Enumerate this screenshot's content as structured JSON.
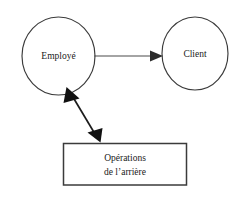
{
  "diagram": {
    "type": "flow-diagram",
    "background_color": "#ffffff",
    "stroke_color": "#3b3b3b",
    "text_color": "#1a1a1a",
    "nodes": [
      {
        "id": "employe",
        "shape": "ellipse",
        "label": "Employé"
      },
      {
        "id": "client",
        "shape": "ellipse",
        "label": "Client"
      },
      {
        "id": "operations",
        "shape": "rectangle",
        "label_line1": "Opérations",
        "label_line2": "de l’arrière"
      }
    ],
    "connectors": [
      {
        "id": "employe-to-client",
        "from": "employe",
        "to": "client",
        "direction": "one-way",
        "orientation": "horizontal"
      },
      {
        "id": "employe-to-operations",
        "from": "employe",
        "to": "operations",
        "direction": "two-way",
        "orientation": "diagonal"
      }
    ]
  }
}
